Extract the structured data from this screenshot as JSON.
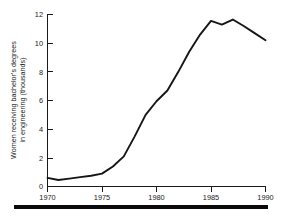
{
  "chart_data": {
    "type": "line",
    "title": "",
    "xlabel": "",
    "ylabel": "Women receiving bachelor's degrees in engineering (thousands)",
    "ylabel_line1": "Women receiving bachelor's degrees",
    "ylabel_line2": "in engineering (thousands)",
    "xlim": [
      1970,
      1990
    ],
    "ylim": [
      0,
      12
    ],
    "grid": false,
    "legend": false,
    "line_color": "#151515",
    "axis_color": "#1a1a1a",
    "background_color": "#ffffff",
    "xticks": [
      1970,
      1975,
      1980,
      1985,
      1990
    ],
    "xtick_labels": [
      "1970",
      "1975",
      "1980",
      "1985",
      "1990"
    ],
    "yticks": [
      0,
      2,
      4,
      6,
      8,
      10,
      12
    ],
    "ytick_labels": [
      "0",
      "2",
      "4",
      "6",
      "8",
      "10",
      "12"
    ],
    "x": [
      1970,
      1971,
      1972,
      1973,
      1974,
      1975,
      1976,
      1977,
      1978,
      1979,
      1980,
      1981,
      1982,
      1983,
      1984,
      1985,
      1986,
      1987,
      1988,
      1989,
      1990
    ],
    "values": [
      0.6,
      0.45,
      0.55,
      0.65,
      0.75,
      0.9,
      1.4,
      2.1,
      3.5,
      5.0,
      5.95,
      6.7,
      8.0,
      9.4,
      10.6,
      11.55,
      11.3,
      11.65,
      11.2,
      10.7,
      10.2
    ],
    "series": [
      {
        "name": "Women receiving bachelor's degrees in engineering",
        "values": [
          0.6,
          0.45,
          0.55,
          0.65,
          0.75,
          0.9,
          1.4,
          2.1,
          3.5,
          5.0,
          5.95,
          6.7,
          8.0,
          9.4,
          10.6,
          11.55,
          11.3,
          11.65,
          11.2,
          10.7,
          10.2
        ]
      }
    ]
  },
  "footer": {
    "rule_present": true
  }
}
